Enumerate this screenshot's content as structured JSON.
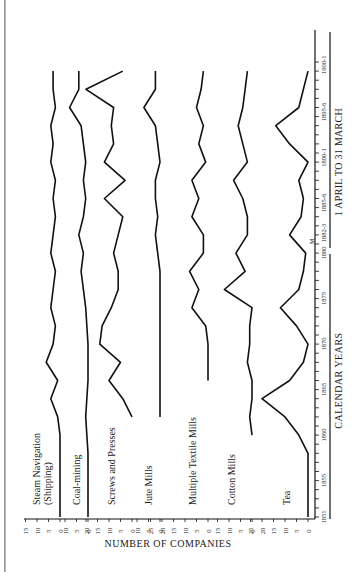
{
  "chart_data": {
    "type": "line",
    "orientation": "rotated-90-ccw",
    "title": "",
    "xlabel": "CALENDAR YEARS",
    "xlabel_secondary": "1 APRIL TO 31 MARCH",
    "ylabel": "NUMBER OF COMPANIES",
    "x_ticks": [
      "1851",
      "1855",
      "1860",
      "1865",
      "1870",
      "1875",
      "1880",
      "1882-3",
      "1885-6",
      "1890-1",
      "1895-6",
      "1900-1"
    ],
    "x_marker": "M",
    "x_range": [
      1851,
      1901
    ],
    "grid": false,
    "legend": "inline labels",
    "panels": [
      {
        "name": "Steam Navigation (Shipping)",
        "y_ticks": [
          "0",
          "5",
          "10",
          "15"
        ],
        "x": [
          1851,
          1860,
          1862,
          1864,
          1866,
          1868,
          1870,
          1872,
          1874,
          1876,
          1878,
          1880,
          1882,
          1884,
          1886,
          1888,
          1890,
          1892,
          1894,
          1896,
          1898,
          1900
        ],
        "values": [
          0,
          0,
          1,
          4,
          1,
          6,
          3,
          2,
          4,
          3,
          2,
          4,
          3,
          2,
          3,
          2,
          4,
          3,
          4,
          2,
          3,
          3
        ]
      },
      {
        "name": "Coal-mining",
        "y_ticks": [
          "0",
          "5",
          "10"
        ],
        "x": [
          1851,
          1858,
          1862,
          1866,
          1870,
          1874,
          1878,
          1880,
          1882,
          1884,
          1886,
          1888,
          1890,
          1892,
          1894,
          1896,
          1898,
          1900
        ],
        "values": [
          0,
          0,
          1,
          0,
          0,
          1,
          3,
          2,
          4,
          2,
          1,
          2,
          1,
          2,
          3,
          8,
          4,
          4
        ]
      },
      {
        "name": "Screws and Presses",
        "y_ticks": [
          "0",
          "5",
          "10",
          "15",
          "20"
        ],
        "x": [
          1862,
          1864,
          1866,
          1868,
          1870,
          1872,
          1874,
          1876,
          1878,
          1880,
          1882,
          1884,
          1886,
          1888,
          1890,
          1892,
          1894,
          1896,
          1898,
          1900
        ],
        "values": [
          0,
          4,
          10,
          5,
          14,
          13,
          9,
          6,
          6,
          8,
          6,
          4,
          12,
          3,
          12,
          8,
          9,
          8,
          20,
          4
        ]
      },
      {
        "name": "Jute Mills",
        "y_ticks": [
          "0",
          "5",
          "10"
        ],
        "x": [
          1862,
          1866,
          1870,
          1874,
          1878,
          1880,
          1882,
          1884,
          1886,
          1888,
          1890,
          1892,
          1894,
          1896,
          1898,
          1900
        ],
        "values": [
          0,
          0,
          0,
          0,
          0,
          1,
          2,
          1,
          2,
          2,
          0,
          1,
          2,
          7,
          2,
          2
        ]
      },
      {
        "name": "Multiple Textile Mills",
        "y_ticks": [
          "0",
          "5",
          "10",
          "15",
          "20",
          "25"
        ],
        "x": [
          1866,
          1868,
          1870,
          1872,
          1874,
          1876,
          1878,
          1880,
          1882,
          1884,
          1886,
          1888,
          1890,
          1892,
          1894,
          1896,
          1898,
          1900
        ],
        "values": [
          0,
          0,
          0,
          1,
          7,
          4,
          8,
          2,
          2,
          7,
          4,
          7,
          1,
          4,
          2,
          5,
          3,
          2
        ]
      },
      {
        "name": "Cotton Mills",
        "y_ticks": [
          "0",
          "5",
          "10",
          "15"
        ],
        "x": [
          1860,
          1862,
          1864,
          1866,
          1868,
          1870,
          1872,
          1874,
          1876,
          1878,
          1880,
          1882,
          1884,
          1886,
          1888,
          1890,
          1892,
          1894,
          1896,
          1898,
          1900
        ],
        "values": [
          0,
          1,
          0,
          0,
          2,
          1,
          1,
          0,
          12,
          3,
          7,
          2,
          2,
          4,
          8,
          2,
          4,
          6,
          4,
          3,
          2
        ]
      },
      {
        "name": "Tea",
        "y_ticks": [
          "0",
          "5",
          "10",
          "15",
          "20",
          "25"
        ],
        "x": [
          1851,
          1858,
          1860,
          1862,
          1864,
          1866,
          1868,
          1870,
          1872,
          1874,
          1876,
          1878,
          1880,
          1882,
          1884,
          1886,
          1888,
          1890,
          1892,
          1894,
          1896,
          1898,
          1900
        ],
        "values": [
          0,
          0,
          4,
          10,
          20,
          8,
          2,
          0,
          5,
          12,
          4,
          2,
          1,
          8,
          3,
          2,
          4,
          0,
          8,
          14,
          4,
          2,
          0
        ]
      }
    ]
  },
  "labels": {
    "ylabel": "NUMBER OF COMPANIES",
    "xlabel": "CALENDAR YEARS",
    "xlabel_secondary": "1 APRIL TO 31 MARCH",
    "marker": "M",
    "series": [
      "Steam Navigation",
      "(Shipping)",
      "Coal-mining",
      "Screws and Presses",
      "Jute Mills",
      "Multiple Textile Mills",
      "Cotton Mills",
      "Tea"
    ],
    "years": [
      "1851",
      "1855",
      "1860",
      "1865",
      "1870",
      "1875",
      "1880",
      "1882-3",
      "1885-6",
      "1890-1",
      "1895-6",
      "1900-1"
    ]
  }
}
